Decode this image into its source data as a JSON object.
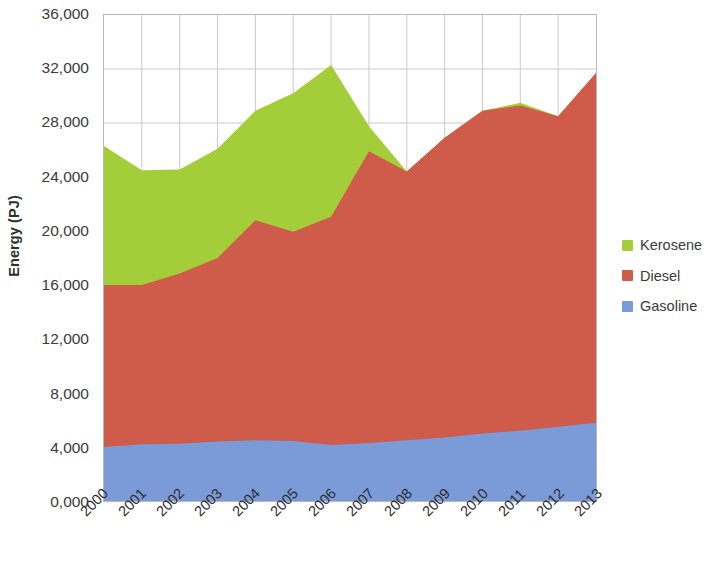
{
  "chart_data": {
    "type": "area",
    "stacked": true,
    "title": "",
    "subtitle": "",
    "xlabel": "",
    "ylabel": "Energy (PJ)",
    "categories": [
      "2000",
      "2001",
      "2002",
      "2003",
      "2004",
      "2005",
      "2006",
      "2007",
      "2008",
      "2009",
      "2010",
      "2011",
      "2012",
      "2013"
    ],
    "x_tick_labels": [
      "2000",
      "2001",
      "2002",
      "2003",
      "2004",
      "2005",
      "2006",
      "2007",
      "2008",
      "2009",
      "2010",
      "2011",
      "2012",
      "2013"
    ],
    "y_tick_labels": [
      "36,000",
      "32,000",
      "28,000",
      "24,000",
      "20,000",
      "16,000",
      "12,000",
      "8,000",
      "4,000",
      "0,000"
    ],
    "y_tick_values": [
      36000,
      32000,
      28000,
      24000,
      20000,
      16000,
      12000,
      8000,
      4000,
      0
    ],
    "ylim": [
      0,
      36000
    ],
    "grid": true,
    "grid_x": true,
    "grid_y": true,
    "legend_position": "right",
    "series": [
      {
        "name": "Gasoline",
        "color": "#7b9ad8",
        "values": [
          4000,
          4200,
          4250,
          4400,
          4500,
          4450,
          4150,
          4300,
          4500,
          4700,
          5000,
          5200,
          5500,
          5800
        ]
      },
      {
        "name": "Diesel",
        "color": "#cf5b4a",
        "values": [
          12000,
          11800,
          12600,
          13600,
          16300,
          15500,
          16900,
          21600,
          19900,
          22200,
          23900,
          24100,
          23000,
          25900
        ]
      },
      {
        "name": "Kerosene",
        "color": "#a4ce39",
        "values": [
          10300,
          8500,
          7700,
          8100,
          8100,
          10250,
          11250,
          1850,
          0,
          0,
          0,
          200,
          0,
          0
        ]
      }
    ],
    "series_totals": [
      26300,
      24500,
      24550,
      26100,
      28900,
      30200,
      32300,
      27750,
      24400,
      26900,
      28900,
      29500,
      28500,
      31700
    ]
  },
  "legend": {
    "items": [
      {
        "label": "Kerosene",
        "color": "#a4ce39"
      },
      {
        "label": "Diesel",
        "color": "#cf5b4a"
      },
      {
        "label": "Gasoline",
        "color": "#7b9ad8"
      }
    ]
  },
  "axes": {
    "y_title": "Energy (PJ)"
  },
  "colors": {
    "kerosene": "#a4ce39",
    "diesel": "#cf5b4a",
    "gasoline": "#7b9ad8",
    "grid": "#c9c9c9",
    "border": "#b9b9b9",
    "text": "#3a3a3a"
  }
}
